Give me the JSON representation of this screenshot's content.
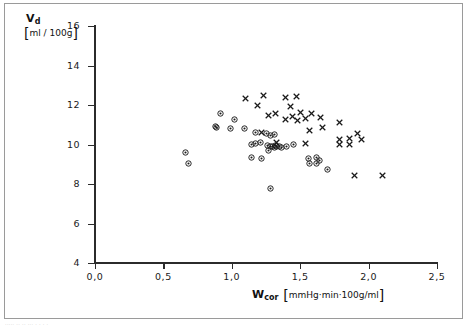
{
  "figure": {
    "caption_fragment": "·····  ··    ··                ··· ·    ·      ·             ·"
  },
  "chart_data": {
    "type": "scatter",
    "title": "",
    "xlabel": "W_cor [mmHg·min·100g/ml]",
    "ylabel": "V_d [ml/100g]",
    "xlim": [
      0.0,
      2.5
    ],
    "ylim": [
      4,
      16
    ],
    "grid": false,
    "legend": "none",
    "axis": {
      "x": {
        "symbol": "W",
        "subscript": "cor",
        "units": "mmHg·min·100g/ml",
        "ticks": [
          0.0,
          0.5,
          1.0,
          1.5,
          2.0,
          2.5
        ],
        "tick_labels": [
          "0,0",
          "0,5",
          "1,0",
          "1,5",
          "2,0",
          "2,5"
        ]
      },
      "y": {
        "symbol": "V",
        "subscript": "d",
        "units": "ml / 100g",
        "ticks": [
          4,
          6,
          8,
          10,
          12,
          14,
          16
        ],
        "tick_labels": [
          "4",
          "6",
          "8",
          "10",
          "12",
          "14",
          "16"
        ]
      }
    },
    "series": [
      {
        "name": "cross-marker-series",
        "marker": "cross",
        "color": "#1a1a1a",
        "points": [
          [
            1.1,
            12.35
          ],
          [
            1.23,
            12.5
          ],
          [
            1.39,
            12.4
          ],
          [
            1.47,
            12.42
          ],
          [
            1.19,
            12.0
          ],
          [
            1.43,
            11.95
          ],
          [
            1.32,
            11.55
          ],
          [
            1.5,
            11.63
          ],
          [
            1.58,
            11.55
          ],
          [
            1.27,
            11.45
          ],
          [
            1.44,
            11.4
          ],
          [
            1.54,
            11.3
          ],
          [
            1.65,
            11.35
          ],
          [
            1.39,
            11.28
          ],
          [
            1.48,
            11.2
          ],
          [
            1.79,
            11.1
          ],
          [
            1.57,
            10.72
          ],
          [
            1.66,
            10.85
          ],
          [
            1.22,
            10.6
          ],
          [
            1.92,
            10.55
          ],
          [
            1.79,
            10.28
          ],
          [
            1.86,
            10.3
          ],
          [
            1.95,
            10.28
          ],
          [
            1.79,
            9.98
          ],
          [
            1.86,
            9.98
          ],
          [
            1.54,
            10.05
          ],
          [
            1.33,
            10.1
          ],
          [
            1.9,
            8.42
          ],
          [
            2.1,
            8.45
          ]
        ]
      },
      {
        "name": "circle-dot-marker-series",
        "marker": "circle-dot",
        "color": "#1a1a1a",
        "points": [
          [
            0.92,
            11.58
          ],
          [
            1.02,
            11.28
          ],
          [
            0.88,
            10.9
          ],
          [
            0.89,
            10.88
          ],
          [
            0.99,
            10.82
          ],
          [
            1.09,
            10.8
          ],
          [
            1.17,
            10.62
          ],
          [
            1.25,
            10.55
          ],
          [
            1.28,
            10.45
          ],
          [
            1.31,
            10.52
          ],
          [
            1.21,
            10.12
          ],
          [
            1.17,
            10.05
          ],
          [
            1.14,
            10.02
          ],
          [
            1.26,
            9.95
          ],
          [
            1.28,
            9.92
          ],
          [
            1.3,
            9.9
          ],
          [
            1.32,
            9.93
          ],
          [
            1.33,
            9.88
          ],
          [
            1.35,
            9.92
          ],
          [
            1.31,
            9.84
          ],
          [
            1.36,
            9.85
          ],
          [
            1.4,
            9.88
          ],
          [
            1.27,
            9.72
          ],
          [
            1.45,
            10.02
          ],
          [
            0.66,
            9.6
          ],
          [
            0.68,
            9.05
          ],
          [
            1.14,
            9.35
          ],
          [
            1.22,
            9.3
          ],
          [
            1.56,
            9.28
          ],
          [
            1.62,
            9.32
          ],
          [
            1.64,
            9.18
          ],
          [
            1.57,
            9.05
          ],
          [
            1.62,
            9.02
          ],
          [
            1.7,
            8.72
          ],
          [
            1.28,
            7.78
          ]
        ]
      }
    ]
  }
}
